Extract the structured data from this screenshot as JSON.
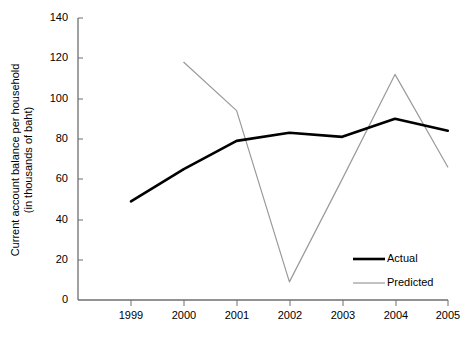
{
  "chart_data": {
    "type": "line",
    "title": "",
    "xlabel": "",
    "ylabel": "Current account balance per household (in thousands of baht)",
    "ylabel_line1": "Current account balance per household",
    "ylabel_line2": "(in thousands of baht)",
    "categories": [
      "1999",
      "2000",
      "2001",
      "2002",
      "2003",
      "2004",
      "2005"
    ],
    "yticks": [
      "0",
      "20",
      "40",
      "60",
      "80",
      "100",
      "120",
      "140"
    ],
    "ytick_values": [
      0,
      20,
      40,
      60,
      80,
      100,
      120,
      140
    ],
    "ylim": [
      0,
      140
    ],
    "grid": false,
    "legend_position": "bottom-right",
    "series": [
      {
        "name": "Actual",
        "color": "#000000",
        "width": 2.6,
        "values": [
          49,
          65,
          79,
          83,
          81,
          90,
          84
        ]
      },
      {
        "name": "Predicted",
        "color": "#9a9a9a",
        "width": 1.2,
        "values": [
          null,
          118,
          94,
          9,
          60,
          112,
          66
        ]
      }
    ]
  },
  "legend": {
    "items": [
      {
        "label": "Actual"
      },
      {
        "label": "Predicted"
      }
    ]
  },
  "colors": {
    "actual": "#000000",
    "predicted": "#9a9a9a",
    "axis": "#6e6e6e",
    "text": "#000000",
    "background": "#ffffff"
  }
}
